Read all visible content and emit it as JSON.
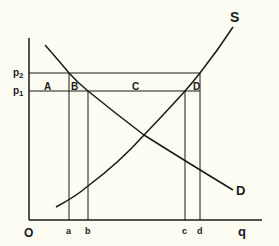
{
  "diagram": {
    "type": "supply-demand",
    "background": "#fdfdf3",
    "line_color": "#1a1a1a",
    "origin_label": "O",
    "x_axis_label": "q",
    "price_labels": {
      "p2": "p",
      "p2_sub": "2",
      "p1": "p",
      "p1_sub": "1"
    },
    "quantity_labels": [
      "a",
      "b",
      "c",
      "d"
    ],
    "area_labels": [
      "A",
      "B",
      "C",
      "D"
    ],
    "curve_labels": {
      "supply": "S",
      "demand": "D"
    }
  }
}
